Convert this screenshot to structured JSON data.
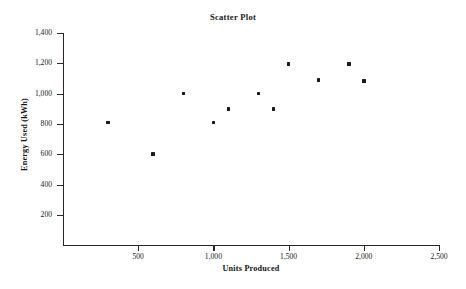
{
  "chart_data": {
    "type": "scatter",
    "title": "Scatter Plot",
    "xlabel": "Units Produced",
    "ylabel": "Energy Used (kWh)",
    "xlim": [
      0,
      2500
    ],
    "ylim": [
      0,
      1400
    ],
    "grid": false,
    "legend": null,
    "x_ticks": [
      500,
      1000,
      1500,
      2000,
      2500
    ],
    "x_tick_labels": [
      "500",
      "1,000",
      "1,500",
      "2,000",
      "2,500"
    ],
    "y_ticks": [
      200,
      400,
      600,
      800,
      1000,
      1200,
      1400
    ],
    "y_tick_labels": [
      "200",
      "400",
      "600",
      "800",
      "1,000",
      "1,200",
      "1,400"
    ],
    "marker": "filled-square",
    "marker_color": "#1b1b1b",
    "points": [
      {
        "x": 300,
        "y": 810
      },
      {
        "x": 600,
        "y": 600
      },
      {
        "x": 800,
        "y": 1000
      },
      {
        "x": 1000,
        "y": 810
      },
      {
        "x": 1100,
        "y": 900
      },
      {
        "x": 1300,
        "y": 1000
      },
      {
        "x": 1400,
        "y": 900
      },
      {
        "x": 1500,
        "y": 1195
      },
      {
        "x": 1700,
        "y": 1090
      },
      {
        "x": 1900,
        "y": 1195
      },
      {
        "x": 2000,
        "y": 1085
      }
    ],
    "x": [
      300,
      600,
      800,
      1000,
      1100,
      1300,
      1400,
      1500,
      1700,
      1900,
      2000
    ],
    "values": [
      810,
      600,
      1000,
      810,
      900,
      1000,
      900,
      1195,
      1090,
      1195,
      1085
    ]
  },
  "figure": {
    "background_color": "#ffffff",
    "axis_color": "#262626"
  }
}
